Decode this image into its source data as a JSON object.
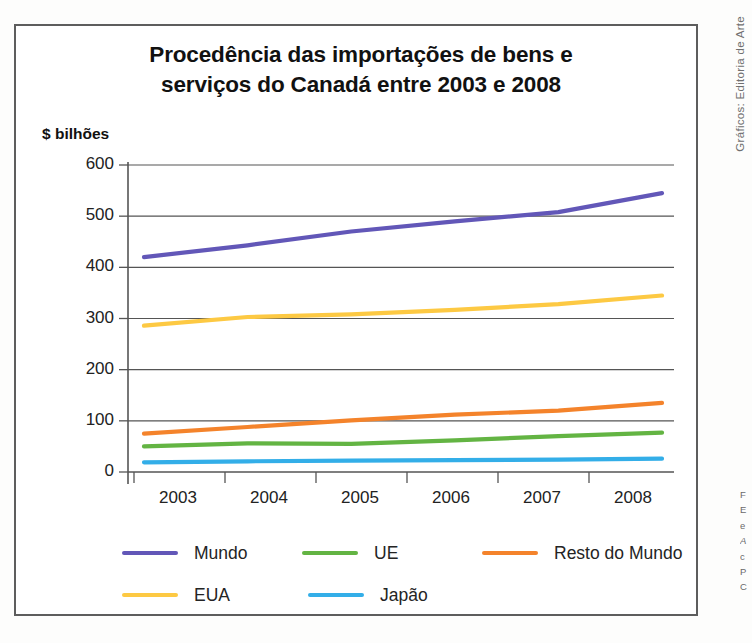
{
  "figure": {
    "title_line1": "Procedência das importações de bens e",
    "title_line2": "serviços do Canadá entre 2003 e 2008",
    "y_unit_label": "$ bilhões",
    "side_credit": "Gráficos: Editoria de Arte",
    "side_caption_lines": [
      "F",
      "E",
      "e",
      "A",
      "c",
      "P",
      "C"
    ]
  },
  "chart_data": {
    "type": "line",
    "title": "Procedência das importações de bens e serviços do Canadá entre 2003 e 2008",
    "xlabel": "",
    "ylabel": "$ bilhões",
    "categories": [
      "2003",
      "2004",
      "2005",
      "2006",
      "2007",
      "2008"
    ],
    "x": [
      2003,
      2004,
      2005,
      2006,
      2007,
      2008
    ],
    "ylim": [
      0,
      600
    ],
    "yticks": [
      0,
      100,
      200,
      300,
      400,
      500,
      600
    ],
    "ytick_labels": [
      "0",
      "100",
      "200",
      "300",
      "400",
      "500",
      "600"
    ],
    "grid": true,
    "grid_axis": "y",
    "legend_position": "bottom",
    "series": [
      {
        "name": "Mundo",
        "color": "#6257B8",
        "values": [
          420,
          443,
          470,
          490,
          508,
          545
        ]
      },
      {
        "name": "UE",
        "color": "#63B443",
        "values": [
          50,
          56,
          55,
          62,
          70,
          77
        ]
      },
      {
        "name": "Resto do Mundo",
        "color": "#F4832B",
        "values": [
          75,
          88,
          101,
          112,
          120,
          135
        ]
      },
      {
        "name": "EUA",
        "color": "#FDC943",
        "values": [
          286,
          303,
          308,
          317,
          328,
          345
        ]
      },
      {
        "name": "Japão",
        "color": "#33AEE8",
        "values": [
          19,
          21,
          22,
          23,
          24,
          26
        ]
      }
    ]
  },
  "legend": {
    "rows": [
      [
        {
          "label": "Mundo",
          "color": "#6257B8"
        },
        {
          "label": "UE",
          "color": "#63B443"
        },
        {
          "label": "Resto do Mundo",
          "color": "#F4832B"
        }
      ],
      [
        {
          "label": "EUA",
          "color": "#FDC943"
        },
        {
          "label": "Japão",
          "color": "#33AEE8"
        }
      ]
    ]
  },
  "axes": {
    "y_tick_labels": [
      "600",
      "500",
      "400",
      "300",
      "200",
      "100",
      "0"
    ],
    "x_tick_labels": [
      "2003",
      "2004",
      "2005",
      "2006",
      "2007",
      "2008"
    ]
  }
}
